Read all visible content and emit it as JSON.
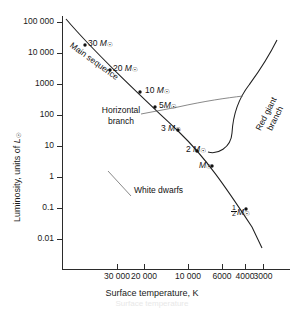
{
  "figure": {
    "kind": "hertzsprung-russell-diagram",
    "background": "#ffffff",
    "curve_color": "#1f1f1f",
    "leader_color": "#6b6b6b"
  },
  "axes": {
    "x_title": "Surface temperature, K",
    "y_title_parts": {
      "pre": "Luminosity, units of ",
      "symbol": "L",
      "sub": "☉"
    },
    "x_ticks": [
      {
        "label": "30 000",
        "value": 30000,
        "px": 117
      },
      {
        "label": "20 000",
        "value": 20000,
        "px": 144
      },
      {
        "label": "10 000",
        "value": 10000,
        "px": 188
      },
      {
        "label": "6000",
        "value": 6000,
        "px": 222
      },
      {
        "label": "4000",
        "value": 4000,
        "px": 245
      },
      {
        "label": "3000",
        "value": 3000,
        "px": 263
      }
    ],
    "y_ticks": [
      {
        "label": "100 000",
        "value": 100000,
        "px": 22
      },
      {
        "label": "10 000",
        "value": 10000,
        "px": 53
      },
      {
        "label": "1000",
        "value": 1000,
        "px": 84
      },
      {
        "label": "100",
        "value": 100,
        "px": 115
      },
      {
        "label": "10",
        "value": 10,
        "px": 146
      },
      {
        "label": "1",
        "value": 1,
        "px": 177
      },
      {
        "label": "0.1",
        "value": 0.1,
        "px": 208
      },
      {
        "label": "0.01",
        "value": 0.01,
        "px": 239
      }
    ],
    "x_range_reversed": true,
    "y_log": true,
    "grid": false
  },
  "annotations": {
    "main_sequence": "Main sequence",
    "horizontal_branch_line1": "Horizontal",
    "horizontal_branch_line2": "branch",
    "red_giant_line1": "Red giant",
    "red_giant_line2": "branch",
    "white_dwarfs": "White dwarfs"
  },
  "mass_labels": [
    {
      "id": "m30",
      "text": "30",
      "unit": "M",
      "sub": "☉",
      "x": 88,
      "y": 41
    },
    {
      "id": "m20",
      "text": "20",
      "unit": "M",
      "sub": "☉",
      "x": 113,
      "y": 66
    },
    {
      "id": "m10",
      "text": "10",
      "unit": "M",
      "sub": "☉",
      "x": 146,
      "y": 88
    },
    {
      "id": "m5",
      "text": "5",
      "unit": "M",
      "sub": "☉",
      "x": 160,
      "y": 103
    },
    {
      "id": "m3",
      "text": "3",
      "unit": "M",
      "sub": "☉",
      "x": 162,
      "y": 126
    },
    {
      "id": "m2",
      "text": "2",
      "unit": "M",
      "sub": "☉",
      "x": 187,
      "y": 147
    },
    {
      "id": "m1",
      "text": "",
      "unit": "M",
      "sub": "☉",
      "x": 199,
      "y": 163
    },
    {
      "id": "mhalf",
      "text": "frac",
      "unit": "M",
      "sub": "☉",
      "x": 231,
      "y": 210
    }
  ],
  "data_points": [
    {
      "mass": 30,
      "x": 85,
      "y": 45
    },
    {
      "mass": 20,
      "x": 110,
      "y": 70
    },
    {
      "mass": 10,
      "x": 140,
      "y": 92
    },
    {
      "mass": 5,
      "x": 155,
      "y": 107
    },
    {
      "mass": 3,
      "x": 178,
      "y": 130
    },
    {
      "mass": 2,
      "x": 197,
      "y": 151
    },
    {
      "mass": 1,
      "x": 212,
      "y": 166
    },
    {
      "mass": 0.5,
      "x": 246,
      "y": 209
    }
  ],
  "caption_faint": "Surface temperature"
}
